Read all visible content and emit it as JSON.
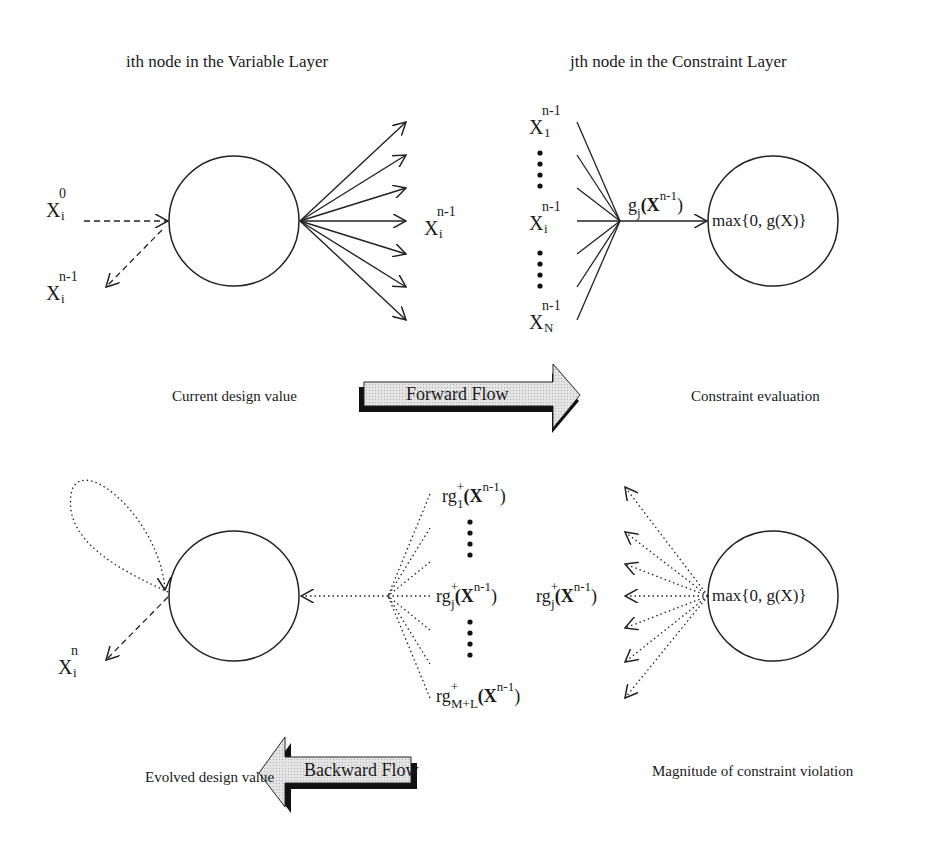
{
  "titles": {
    "variable_layer": "ith node in the Variable Layer",
    "constraint_layer": "jth node in the Constraint Layer"
  },
  "forward": {
    "x_i_0": {
      "base": "X",
      "sup": "0",
      "sub": "i"
    },
    "x_i_n1_left": {
      "base": "X",
      "sup": "n-1",
      "sub": "i"
    },
    "x_i_n1_right": {
      "base": "X",
      "sup": "n-1",
      "sub": "i"
    },
    "inputs": [
      {
        "base": "X",
        "sup": "n-1",
        "sub": "1"
      },
      {
        "base": "X",
        "sup": "n-1",
        "sub": "i"
      },
      {
        "base": "X",
        "sup": "n-1",
        "sub": "N"
      }
    ],
    "edge_label": {
      "g": "g",
      "sub": "j",
      "arg": "(X",
      "sup": "n-1",
      "close": ")"
    },
    "constraint_node_text": "max{0, g(X)}",
    "caption_left": "Current design value",
    "arrow_label": "Forward Flow",
    "caption_right": "Constraint evaluation"
  },
  "backward": {
    "terms": [
      {
        "r": "r",
        "g": "g",
        "plus": "+",
        "sub": "1",
        "arg": "(X",
        "sup": "n-1",
        "close": ")"
      },
      {
        "r": "r",
        "g": "g",
        "plus": "+",
        "sub": "j",
        "arg": "(X",
        "sup": "n-1",
        "close": ")"
      },
      {
        "r": "r",
        "g": "g",
        "plus": "+",
        "sub": "M+L",
        "arg": "(X",
        "sup": "n-1",
        "close": ")"
      }
    ],
    "middle_term": {
      "r": "r",
      "g": "g",
      "plus": "+",
      "sub": "j",
      "arg": "(X",
      "sup": "n-1",
      "close": ")"
    },
    "constraint_node_text": "max{0, g(X)}",
    "x_i_n": {
      "base": "X",
      "sup": "n",
      "sub": "i"
    },
    "caption_left": "Evolved design value",
    "arrow_label": "Backward Flow",
    "caption_right": "Magnitude of constraint violation"
  }
}
